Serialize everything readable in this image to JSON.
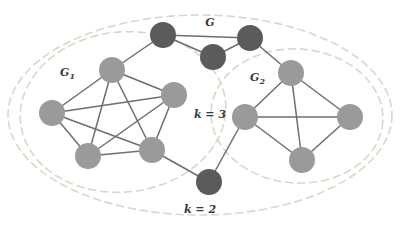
{
  "figure": {
    "background_color": "#ffffff",
    "width": 401,
    "height": 230
  },
  "colors": {
    "node_light": "#9a9a9a",
    "node_dark": "#5b5b5b",
    "edge": "#6e6e6e",
    "boundary_outer": "#d8d8c8",
    "boundary_inner": "#d8d8c8",
    "label_text": "#3a3a3a"
  },
  "labels": {
    "graph_g": {
      "text": "G",
      "x": 210,
      "y": 26
    },
    "subgraph_g1": {
      "base": "G",
      "sub": "1",
      "x": 60,
      "y": 76
    },
    "subgraph_g2": {
      "base": "G",
      "sub": "2",
      "x": 250,
      "y": 81
    },
    "k_three": {
      "text": "k = 3",
      "x": 210,
      "y": 118
    },
    "k_two": {
      "text": "k = 2",
      "x": 200,
      "y": 213
    }
  },
  "boundaries": [
    {
      "name": "outer-ellipse-k2",
      "cx": 200,
      "cy": 115,
      "rx": 192,
      "ry": 100,
      "rotation": 0
    },
    {
      "name": "inner-ellipse-g1",
      "cx": 123,
      "cy": 112,
      "rx": 103,
      "ry": 80,
      "rotation": -6
    },
    {
      "name": "inner-ellipse-g2",
      "cx": 297,
      "cy": 116,
      "rx": 86,
      "ry": 67,
      "rotation": 4
    }
  ],
  "graph_data": {
    "type": "node-link-diagram",
    "nodes": [
      {
        "id": "a1",
        "label": "",
        "x": 52,
        "y": 113,
        "r": 13,
        "group": "G1",
        "shade": "light"
      },
      {
        "id": "a2",
        "label": "",
        "x": 112,
        "y": 70,
        "r": 13,
        "group": "G1",
        "shade": "light"
      },
      {
        "id": "a3",
        "label": "",
        "x": 174,
        "y": 95,
        "r": 13,
        "group": "G1",
        "shade": "light"
      },
      {
        "id": "a4",
        "label": "",
        "x": 88,
        "y": 156,
        "r": 13,
        "group": "G1",
        "shade": "light"
      },
      {
        "id": "a5",
        "label": "",
        "x": 152,
        "y": 150,
        "r": 13,
        "group": "G1",
        "shade": "light"
      },
      {
        "id": "b1",
        "label": "",
        "x": 163,
        "y": 35,
        "r": 13,
        "group": "G",
        "shade": "dark"
      },
      {
        "id": "b2",
        "label": "",
        "x": 250,
        "y": 38,
        "r": 13,
        "group": "G",
        "shade": "dark"
      },
      {
        "id": "b3",
        "label": "",
        "x": 213,
        "y": 57,
        "r": 13,
        "group": "G",
        "shade": "dark"
      },
      {
        "id": "b4",
        "label": "",
        "x": 209,
        "y": 182,
        "r": 13,
        "group": "G",
        "shade": "dark"
      },
      {
        "id": "c1",
        "label": "",
        "x": 291,
        "y": 73,
        "r": 13,
        "group": "G2",
        "shade": "light"
      },
      {
        "id": "c2",
        "label": "",
        "x": 245,
        "y": 117,
        "r": 13,
        "group": "G2",
        "shade": "light"
      },
      {
        "id": "c3",
        "label": "",
        "x": 350,
        "y": 117,
        "r": 13,
        "group": "G2",
        "shade": "light"
      },
      {
        "id": "c4",
        "label": "",
        "x": 302,
        "y": 160,
        "r": 13,
        "group": "G2",
        "shade": "light"
      }
    ],
    "edges": [
      [
        "a1",
        "a2"
      ],
      [
        "a1",
        "a3"
      ],
      [
        "a1",
        "a4"
      ],
      [
        "a1",
        "a5"
      ],
      [
        "a2",
        "a3"
      ],
      [
        "a2",
        "a4"
      ],
      [
        "a2",
        "a5"
      ],
      [
        "a3",
        "a4"
      ],
      [
        "a3",
        "a5"
      ],
      [
        "a4",
        "a5"
      ],
      [
        "a2",
        "b1"
      ],
      [
        "b1",
        "b2"
      ],
      [
        "b1",
        "b3"
      ],
      [
        "b2",
        "b3"
      ],
      [
        "b2",
        "c1"
      ],
      [
        "a5",
        "b4"
      ],
      [
        "b4",
        "c2"
      ],
      [
        "c1",
        "c2"
      ],
      [
        "c1",
        "c3"
      ],
      [
        "c1",
        "c4"
      ],
      [
        "c2",
        "c3"
      ],
      [
        "c2",
        "c4"
      ],
      [
        "c3",
        "c4"
      ]
    ]
  }
}
